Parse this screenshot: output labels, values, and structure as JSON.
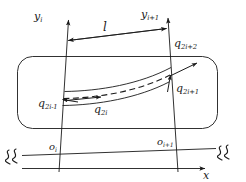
{
  "figure": {
    "type": "engineering-diagram",
    "background_color": "#ffffff",
    "stroke_color": "#1a1a1a"
  },
  "axes": {
    "y_left": {
      "base": "y",
      "sub": "i"
    },
    "y_right": {
      "base": "y",
      "sub": "i+1"
    },
    "x_axis": {
      "base": "x",
      "sub": ""
    },
    "origin_left": {
      "base": "o",
      "sub": "i"
    },
    "origin_right": {
      "base": "o",
      "sub": "i+1"
    }
  },
  "dimension": {
    "length_label": "l"
  },
  "dof": [
    {
      "id": "q2i-1",
      "base": "q",
      "sub": "2i-1",
      "position": "left-node-translation"
    },
    {
      "id": "q2i",
      "base": "q",
      "sub": "2i",
      "position": "left-node-rotation"
    },
    {
      "id": "q2i+1",
      "base": "q",
      "sub": "2i+1",
      "position": "right-node-translation"
    },
    {
      "id": "q2i+2",
      "base": "q",
      "sub": "2i+2",
      "position": "right-node-rotation"
    }
  ],
  "break_symbols": {
    "left": "SS",
    "right": "SS"
  }
}
